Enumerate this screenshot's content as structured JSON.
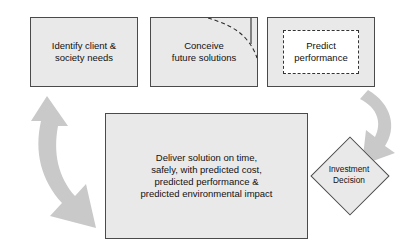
{
  "diagram": {
    "canvas": {
      "width": 416,
      "height": 246,
      "background": "#ffffff"
    },
    "colors": {
      "box_fill": "#e9e9e9",
      "box_stroke": "#4a4a4a",
      "arrow_fill": "#c9c9c9",
      "inner_box_fill": "#ffffff",
      "inner_box_stroke": "#333333",
      "text": "#111111"
    },
    "nodes": [
      {
        "id": "identify",
        "shape": "rectangle",
        "label": "Identify client &\nsociety needs"
      },
      {
        "id": "conceive",
        "shape": "rectangle",
        "label": "Conceive\nfuture solutions"
      },
      {
        "id": "predict",
        "shape": "rectangle",
        "label": "Predict\nperformance",
        "inner_shape": "dashed-rectangle"
      },
      {
        "id": "deliver",
        "shape": "rectangle",
        "label": "Deliver solution on time,\nsafely, with predicted cost,\npredicted performance &\npredicted environmental impact"
      },
      {
        "id": "investment",
        "shape": "diamond",
        "label": "Investment\nDecision"
      }
    ],
    "connectors": [
      {
        "id": "right-curved-arrow",
        "from": "predict",
        "to": "investment",
        "style": "curved-block-arrow",
        "heads": "single-end",
        "direction": "down-left"
      },
      {
        "id": "left-curved-arrow",
        "from": "deliver",
        "to": "identify",
        "style": "curved-block-arrow",
        "heads": "double",
        "direction": "up-and-down-right"
      }
    ],
    "artifacts": [
      {
        "id": "clipped-dashed-curve",
        "location": "conceive-box-top-right-corner",
        "style": "dashed-curve"
      }
    ]
  }
}
